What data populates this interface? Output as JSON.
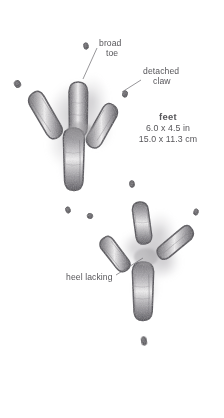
{
  "plate": {
    "subject": "animal-track-illustration",
    "medium": "pencil-graphite-drawing",
    "background_color": "#ffffff",
    "ink_color": "#57565a",
    "track_color_dark": "#5c5a5e",
    "track_color_mid": "#8d8b90",
    "track_color_light": "#c9c7cb"
  },
  "annotations": {
    "broad_toe": {
      "line1": "broad",
      "line2": "toe"
    },
    "detached_claw": {
      "line1": "detached",
      "line2": "claw"
    },
    "heel_lacking": {
      "text": "heel lacking"
    }
  },
  "measurements": {
    "title": "feet",
    "imperial": "6.0 x 4.5 in",
    "metric": "15.0 x 11.3 cm"
  },
  "figure": {
    "upper_track_name": "upper-foot-track",
    "lower_track_name": "lower-foot-track",
    "claw_marks_name": "detached-claw-marks"
  }
}
